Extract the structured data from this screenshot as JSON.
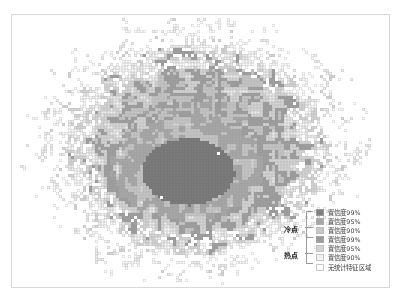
{
  "figure": {
    "type": "hotspot-coldspot-raster-map",
    "title": "",
    "frame": {
      "x": 11,
      "y": 14,
      "width": 379,
      "height": 274,
      "border_color": "#d8d8d8"
    },
    "background": "#ffffff"
  },
  "legend": {
    "position": "bottom-right",
    "groups": [
      {
        "name": "cold-spot",
        "label": "冷点",
        "entries": [
          {
            "label": "置信度99%",
            "color": "#808080",
            "outline": "#9a9a9a"
          },
          {
            "label": "置信度95%",
            "color": "#a6a6a6",
            "outline": "#aeaeae"
          },
          {
            "label": "置信度90%",
            "color": "#c8c8c8",
            "outline": "#bcbcbc"
          }
        ]
      },
      {
        "name": "hot-spot",
        "label": "热点",
        "entries": [
          {
            "label": "置信度99%",
            "color": "#9c9c9c",
            "outline": "#a4a4a4"
          },
          {
            "label": "置信度95%",
            "color": "#d4d4d4",
            "outline": "#c2c2c2"
          },
          {
            "label": "置信度90%",
            "color": "#f2f2f2",
            "outline": "#c6c6c6"
          }
        ]
      }
    ],
    "other": {
      "label": "无统计特征区域",
      "color": "#ffffff",
      "outline": "#c9c9c9"
    }
  },
  "chart_data": {
    "type": "heatmap",
    "title": "",
    "xlabel": "",
    "ylabel": "",
    "cell_size_px": 3,
    "classes": [
      {
        "id": 0,
        "name": "无统计特征区域",
        "fill": "#ffffff",
        "stroke": "#d2d2d2"
      },
      {
        "id": 1,
        "name": "热点 置信度90%",
        "fill": "#f0f0f0",
        "stroke": "#c9c9c9"
      },
      {
        "id": 2,
        "name": "热点 置信度95%",
        "fill": "#d6d6d6",
        "stroke": "#c2c2c2"
      },
      {
        "id": 3,
        "name": "热点 置信度99%",
        "fill": "#9e9e9e",
        "stroke": "#9a9a9a"
      },
      {
        "id": 4,
        "name": "冷点 置信度90%",
        "fill": "#c6c6c6",
        "stroke": "#b8b8b8"
      },
      {
        "id": 5,
        "name": "冷点 置信度95%",
        "fill": "#a8a8a8",
        "stroke": "#a0a0a0"
      },
      {
        "id": 6,
        "name": "冷点 置信度99%",
        "fill": "#7d7d7d",
        "stroke": "#767676"
      }
    ],
    "extent": {
      "x0": 20,
      "y0": 18,
      "x1": 372,
      "y1": 286
    },
    "structure": {
      "core": {
        "cx": 188,
        "cy": 172,
        "rx": 46,
        "ry": 33,
        "class": 6
      },
      "inner_ring": {
        "cx": 188,
        "cy": 166,
        "rx": 74,
        "ry": 52,
        "class": 5
      },
      "cluster_center": {
        "cx": 196,
        "cy": 150
      },
      "cluster_radius": {
        "rx": 150,
        "ry": 122
      },
      "density_falloff": "radial",
      "sparse_periphery": true
    }
  }
}
